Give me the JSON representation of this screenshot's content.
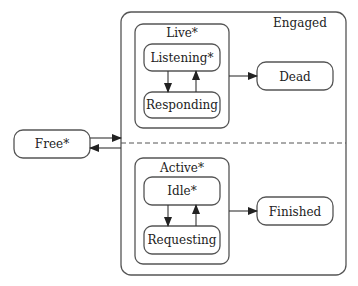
{
  "diagram": {
    "type": "statechart",
    "states": {
      "free": "Free*",
      "engaged": "Engaged",
      "live": "Live*",
      "listening": "Listening*",
      "responding": "Responding",
      "dead": "Dead",
      "active": "Active*",
      "idle": "Idle*",
      "requesting": "Requesting",
      "finished": "Finished"
    },
    "transitions": [
      {
        "from": "Free*",
        "to": "Engaged"
      },
      {
        "from": "Engaged",
        "to": "Free*"
      },
      {
        "from": "Listening*",
        "to": "Responding"
      },
      {
        "from": "Responding",
        "to": "Listening*"
      },
      {
        "from": "Live*",
        "to": "Dead"
      },
      {
        "from": "Idle*",
        "to": "Requesting"
      },
      {
        "from": "Requesting",
        "to": "Idle*"
      },
      {
        "from": "Active*",
        "to": "Finished"
      }
    ],
    "colors": {
      "stroke": "#555555",
      "text": "#222222",
      "background": "#ffffff"
    }
  }
}
